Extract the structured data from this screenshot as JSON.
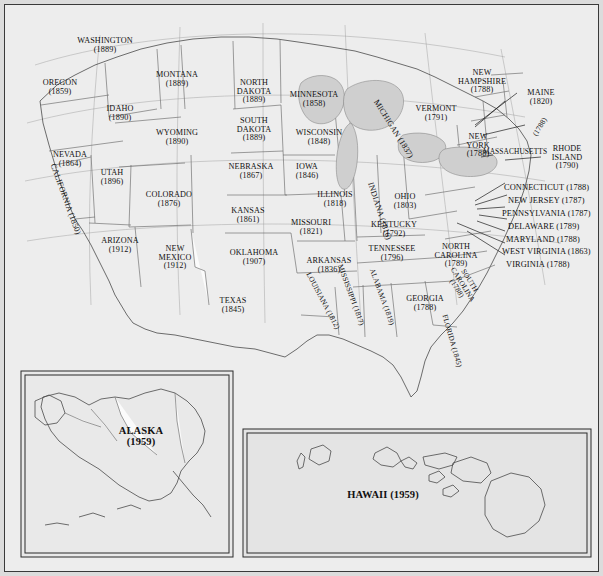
{
  "map": {
    "title": "Map of the United States showing states with year of statehood",
    "projection_note": "Albers-style conic projection, contiguous 48 states with Alaska and Hawaii insets",
    "colors": {
      "page_background": "#dcdcdc",
      "map_background": "#f2f2f2",
      "water": "#d8d8d8",
      "state_outline": "#555555",
      "border_outline": "#2b2b2b",
      "label_text": "#111111"
    }
  },
  "states": [
    {
      "name": "WASHINGTON",
      "year": "(1889)",
      "style": "stacked"
    },
    {
      "name": "OREGON",
      "year": "(1859)",
      "style": "stacked"
    },
    {
      "name": "IDAHO",
      "year": "(1890)",
      "style": "stacked"
    },
    {
      "name": "MONTANA",
      "year": "(1889)",
      "style": "stacked"
    },
    {
      "name": "NORTH DAKOTA",
      "year": "(1889)",
      "style": "stacked"
    },
    {
      "name": "MINNESOTA",
      "year": "(1858)",
      "style": "stacked"
    },
    {
      "name": "WYOMING",
      "year": "(1890)",
      "style": "stacked"
    },
    {
      "name": "SOUTH DAKOTA",
      "year": "(1889)",
      "style": "stacked"
    },
    {
      "name": "WISCONSIN",
      "year": "(1848)",
      "style": "stacked"
    },
    {
      "name": "MICHIGAN",
      "year": "(1837)",
      "style": "rotated"
    },
    {
      "name": "NEVADA",
      "year": "(1864)",
      "style": "stacked"
    },
    {
      "name": "UTAH",
      "year": "(1896)",
      "style": "stacked"
    },
    {
      "name": "NEBRASKA",
      "year": "(1867)",
      "style": "stacked"
    },
    {
      "name": "IOWA",
      "year": "(1846)",
      "style": "stacked"
    },
    {
      "name": "CALIFORNIA",
      "year": "(1850)",
      "style": "rotated"
    },
    {
      "name": "COLORADO",
      "year": "(1876)",
      "style": "stacked"
    },
    {
      "name": "KANSAS",
      "year": "(1861)",
      "style": "stacked"
    },
    {
      "name": "MISSOURI",
      "year": "(1821)",
      "style": "stacked"
    },
    {
      "name": "ILLINOIS",
      "year": "(1818)",
      "style": "stacked"
    },
    {
      "name": "INDIANA",
      "year": "(1816)",
      "style": "rotated"
    },
    {
      "name": "OHIO",
      "year": "(1803)",
      "style": "stacked"
    },
    {
      "name": "ARIZONA",
      "year": "(1912)",
      "style": "stacked"
    },
    {
      "name": "NEW MEXICO",
      "year": "(1912)",
      "style": "stacked"
    },
    {
      "name": "OKLAHOMA",
      "year": "(1907)",
      "style": "stacked"
    },
    {
      "name": "ARKANSAS",
      "year": "(1836)",
      "style": "stacked"
    },
    {
      "name": "TENNESSEE",
      "year": "(1796)",
      "style": "stacked"
    },
    {
      "name": "KENTUCKY",
      "year": "(1792)",
      "style": "stacked"
    },
    {
      "name": "TEXAS",
      "year": "(1845)",
      "style": "stacked"
    },
    {
      "name": "LOUISIANA",
      "year": "(1812)",
      "style": "rotated"
    },
    {
      "name": "MISSISSIPPI",
      "year": "(1817)",
      "style": "rotated"
    },
    {
      "name": "ALABAMA",
      "year": "(1819)",
      "style": "rotated"
    },
    {
      "name": "GEORGIA",
      "year": "(1788)",
      "style": "stacked"
    },
    {
      "name": "FLORIDA",
      "year": "(1845)",
      "style": "rotated"
    },
    {
      "name": "NORTH CAROLINA",
      "year": "(1789)",
      "style": "stacked"
    },
    {
      "name": "SOUTH CAROLINA",
      "year": "(1788)",
      "style": "rotated"
    },
    {
      "name": "VERMONT",
      "year": "(1791)",
      "style": "stacked"
    },
    {
      "name": "NEW HAMPSHIRE",
      "year": "(1788)",
      "style": "stacked"
    },
    {
      "name": "MAINE",
      "year": "(1820)",
      "style": "stacked"
    },
    {
      "name": "NEW YORK",
      "year": "(1788)",
      "style": "stacked"
    },
    {
      "name": "MASSACHUSETTS",
      "year": "(1788)",
      "style": "rotated"
    },
    {
      "name": "RHODE ISLAND",
      "year": "(1790)",
      "style": "stacked"
    },
    {
      "name": "CONNECTICUT",
      "year": "(1788)",
      "style": "callout"
    },
    {
      "name": "NEW JERSEY",
      "year": "(1787)",
      "style": "callout"
    },
    {
      "name": "PENNSYLVANIA",
      "year": "(1787)",
      "style": "callout"
    },
    {
      "name": "DELAWARE",
      "year": "(1789)",
      "style": "callout"
    },
    {
      "name": "MARYLAND",
      "year": "(1788)",
      "style": "callout"
    },
    {
      "name": "WEST VIRGINIA",
      "year": "(1863)",
      "style": "callout"
    },
    {
      "name": "VIRGINIA",
      "year": "(1788)",
      "style": "callout"
    },
    {
      "name": "ALASKA",
      "year": "(1959)",
      "style": "inset"
    },
    {
      "name": "HAWAII",
      "year": "(1959)",
      "style": "inset"
    }
  ],
  "labels": {
    "washington": {
      "name": "WASHINGTON",
      "year": "(1889)"
    },
    "oregon": {
      "name": "OREGON",
      "year": "(1859)"
    },
    "idaho": {
      "name": "IDAHO",
      "year": "(1890)"
    },
    "montana": {
      "name": "MONTANA",
      "year": "(1889)"
    },
    "north_dakota_l1": "NORTH",
    "north_dakota_l2": "DAKOTA",
    "north_dakota_year": "(1889)",
    "minnesota": {
      "name": "MINNESOTA",
      "year": "(1858)"
    },
    "wyoming": {
      "name": "WYOMING",
      "year": "(1890)"
    },
    "south_dakota_l1": "SOUTH",
    "south_dakota_l2": "DAKOTA",
    "south_dakota_year": "(1889)",
    "wisconsin": {
      "name": "WISCONSIN",
      "year": "(1848)"
    },
    "michigan": "MICHIGAN (1837)",
    "nevada": {
      "name": "NEVADA",
      "year": "(1864)"
    },
    "utah": {
      "name": "UTAH",
      "year": "(1896)"
    },
    "nebraska": {
      "name": "NEBRASKA",
      "year": "(1867)"
    },
    "iowa": {
      "name": "IOWA",
      "year": "(1846)"
    },
    "california": "CALIFORNIA (1850)",
    "colorado": {
      "name": "COLORADO",
      "year": "(1876)"
    },
    "kansas": {
      "name": "KANSAS",
      "year": "(1861)"
    },
    "missouri": {
      "name": "MISSOURI",
      "year": "(1821)"
    },
    "illinois": {
      "name": "ILLINOIS",
      "year": "(1818)"
    },
    "indiana": "INDIANA (1816)",
    "ohio": {
      "name": "OHIO",
      "year": "(1803)"
    },
    "arizona": {
      "name": "ARIZONA",
      "year": "(1912)"
    },
    "new_mexico_l1": "NEW",
    "new_mexico_l2": "MEXICO",
    "new_mexico_year": "(1912)",
    "oklahoma": {
      "name": "OKLAHOMA",
      "year": "(1907)"
    },
    "arkansas": {
      "name": "ARKANSAS",
      "year": "(1836)"
    },
    "tennessee": {
      "name": "TENNESSEE",
      "year": "(1796)"
    },
    "kentucky": {
      "name": "KENTUCKY",
      "year": "(1792)"
    },
    "texas": {
      "name": "TEXAS",
      "year": "(1845)"
    },
    "louisiana": "LOUISIANA (1812)",
    "mississippi": "MISSISSIPPI (1817)",
    "alabama": "ALABAMA (1819)",
    "georgia": {
      "name": "GEORGIA",
      "year": "(1788)"
    },
    "florida": "FLORIDA (1845)",
    "north_carolina_l1": "NORTH",
    "north_carolina_l2": "CAROLINA",
    "north_carolina_year": "(1789)",
    "south_carolina_l1": "SOUTH",
    "south_carolina_l2": "CAROLINA",
    "south_carolina_year": "(1788)",
    "vermont": {
      "name": "VERMONT",
      "year": "(1791)"
    },
    "new_hampshire_l1": "NEW",
    "new_hampshire_l2": "HAMPSHIRE",
    "new_hampshire_year": "(1788)",
    "maine": {
      "name": "MAINE",
      "year": "(1820)"
    },
    "new_york_l1": "NEW",
    "new_york_l2": "YORK",
    "new_york_year": "(1788)",
    "massachusetts": "MASSACHUSETTS",
    "massachusetts_year": "(1788)",
    "rhode_island_l1": "RHODE",
    "rhode_island_l2": "ISLAND",
    "rhode_island_year": "(1790)",
    "connecticut": "CONNECTICUT (1788)",
    "new_jersey": "NEW JERSEY (1787)",
    "pennsylvania": "PENNSYLVANIA (1787)",
    "delaware": "DELAWARE (1789)",
    "maryland": "MARYLAND (1788)",
    "west_virginia": "WEST VIRGINIA (1863)",
    "virginia": "VIRGINIA (1788)",
    "alaska": {
      "name": "ALASKA",
      "year": "(1959)"
    },
    "hawaii": "HAWAII (1959)"
  },
  "insets": [
    {
      "id": "alaska-inset",
      "label": "ALASKA",
      "year": "(1959)"
    },
    {
      "id": "hawaii-inset",
      "label": "HAWAII (1959)"
    }
  ]
}
